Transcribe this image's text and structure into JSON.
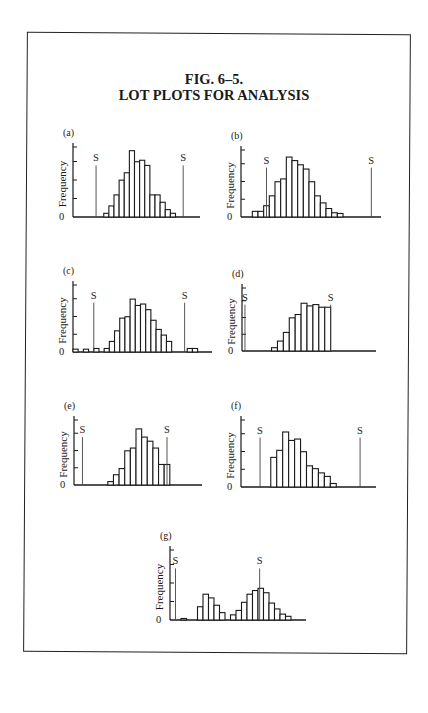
{
  "figure": {
    "title_line1": "FIG. 6–5.",
    "title_line2": "LOT PLOTS FOR ANALYSIS"
  },
  "colors": {
    "ink": "#1a1a1a",
    "spec_line": "#444444",
    "background": "#ffffff"
  },
  "chart_data": [
    {
      "type": "bar",
      "panel": "(a)",
      "ylabel": "Frequency",
      "y_zero_label": "0",
      "y_ticks": 4,
      "spec_labels": [
        "S",
        "S"
      ],
      "bin_count": 24,
      "lower_spec_bin": 4.5,
      "upper_spec_bin": 21.5,
      "values": [
        0,
        0,
        0,
        0,
        0,
        0,
        0.5,
        1.5,
        3,
        5,
        6,
        9,
        7.5,
        7.7,
        7,
        3,
        3,
        2,
        1,
        0.5,
        0,
        0,
        0,
        0
      ],
      "note": "Centered distribution well within both specification limits"
    },
    {
      "type": "bar",
      "panel": "(b)",
      "ylabel": "Frequency",
      "y_zero_label": "0",
      "y_ticks": 4,
      "spec_labels": [
        "S",
        "S"
      ],
      "bin_count": 24,
      "lower_spec_bin": 4.5,
      "upper_spec_bin": 23,
      "values": [
        0,
        0,
        0.8,
        0.8,
        1.6,
        3,
        5,
        5.4,
        8.5,
        8,
        7.4,
        6.8,
        5,
        3,
        2,
        1.2,
        0.6,
        0.5,
        0,
        0,
        0,
        0,
        0,
        0
      ],
      "note": "Distribution shifted toward lower limit, skewed right"
    },
    {
      "type": "bar",
      "panel": "(c)",
      "ylabel": "Frequency",
      "y_zero_label": "0",
      "y_ticks": 4,
      "spec_labels": [
        "S",
        "S"
      ],
      "bin_count": 26,
      "lower_spec_bin": 4,
      "upper_spec_bin": 21.5,
      "values": [
        0.4,
        0,
        0.4,
        0,
        0.5,
        0,
        0.5,
        1.5,
        3,
        4.8,
        5,
        7.5,
        6.6,
        6.8,
        6,
        4.5,
        3.2,
        2.4,
        1.5,
        0,
        0,
        0,
        0.5,
        0.5,
        0,
        0
      ],
      "note": "Scattered outliers beyond both specification limits"
    },
    {
      "type": "bar",
      "panel": "(d)",
      "ylabel": "Frequency",
      "y_zero_label": "0",
      "y_ticks": 4,
      "spec_labels": [
        "S",
        "S"
      ],
      "bin_count": 22,
      "lower_spec_bin": 0.5,
      "upper_spec_bin": 15,
      "values": [
        0,
        0,
        0,
        0,
        0,
        0.5,
        1.5,
        2.8,
        5,
        5.5,
        7.2,
        6.8,
        7,
        6.6,
        6.6,
        0,
        0,
        0,
        0,
        0,
        0,
        0
      ],
      "note": "Truncated at upper limit — screened lot"
    },
    {
      "type": "bar",
      "panel": "(e)",
      "ylabel": "Frequency",
      "y_zero_label": "0",
      "y_ticks": 4,
      "spec_labels": [
        "S",
        "S"
      ],
      "bin_count": 22,
      "lower_spec_bin": 1.5,
      "upper_spec_bin": 16.5,
      "values": [
        0,
        0,
        0,
        0,
        0,
        0,
        0.5,
        1.5,
        2.4,
        5,
        5.4,
        8.2,
        7,
        6.4,
        5.4,
        3,
        3,
        0,
        0,
        0,
        0,
        0
      ],
      "note": "Extends to and truncated near upper limit"
    },
    {
      "type": "bar",
      "panel": "(f)",
      "ylabel": "Frequency",
      "y_zero_label": "0",
      "y_ticks": 4,
      "spec_labels": [
        "S",
        "S"
      ],
      "bin_count": 22,
      "lower_spec_bin": 3.2,
      "upper_spec_bin": 20,
      "values": [
        0,
        0,
        0,
        0,
        0,
        4.2,
        5.2,
        7.8,
        6.6,
        6.8,
        5,
        3,
        2.6,
        2,
        1.5,
        0.5,
        0,
        0,
        0,
        0,
        0,
        0
      ],
      "note": "Sharp lower edge, skewed right, within limits"
    },
    {
      "type": "bar",
      "panel": "(g)",
      "ylabel": "Frequency",
      "y_zero_label": "0",
      "y_ticks": 4,
      "spec_labels": [
        "S",
        "S"
      ],
      "bin_count": 24,
      "lower_spec_bin": 1,
      "upper_spec_bin": 16.3,
      "values": [
        0,
        0,
        0.2,
        0,
        0,
        1.8,
        3.5,
        3,
        2,
        1,
        0,
        0.7,
        1.3,
        2.4,
        3.5,
        4,
        4.3,
        3.7,
        2.3,
        1.5,
        0.8,
        0.5,
        0,
        0
      ],
      "note": "Bimodal distribution — mixed lots"
    }
  ]
}
